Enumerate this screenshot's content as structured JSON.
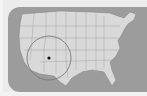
{
  "map": {
    "region": "United States",
    "background_color": "#ececec",
    "panel_color": "#9c9c9c",
    "land_color": "#d9d9d9",
    "border_color": "#8a8a8a",
    "highlight": {
      "shape": "circle",
      "marker": "dot",
      "location_label": "Southwest (Arizona / New Mexico)",
      "marker_color": "#111111",
      "ring_color": "#7a7a7a"
    }
  }
}
